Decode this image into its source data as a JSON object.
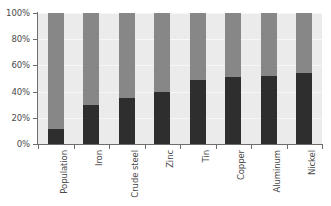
{
  "chart_data": {
    "type": "bar",
    "subtype": "stacked-100-percent",
    "title": "",
    "subtitle": "",
    "xlabel": "",
    "ylabel": "",
    "ylim": [
      0,
      100
    ],
    "yticks": [
      0,
      20,
      40,
      60,
      80,
      100
    ],
    "ytick_labels": [
      "0%",
      "20%",
      "40%",
      "60%",
      "80%",
      "100%"
    ],
    "grid": true,
    "grid_axis": "y",
    "legend": false,
    "legend_position": "none",
    "categories": [
      "Population",
      "Iron",
      "Crude steel",
      "Zinc",
      "Tin",
      "Copper",
      "Aluminum",
      "Nickel"
    ],
    "series": [
      {
        "name": "lower-segment",
        "color": "#2e2e2e",
        "values": [
          11.5,
          29.5,
          35.0,
          40.0,
          49.0,
          51.5,
          52.0,
          54.0
        ]
      },
      {
        "name": "upper-segment",
        "color": "#878787",
        "values": [
          88.5,
          70.5,
          65.0,
          60.0,
          51.0,
          48.5,
          48.0,
          46.0
        ]
      }
    ],
    "annotations": [],
    "colors": {
      "plot_background": "#ebebeb",
      "figure_background": "#ffffff",
      "axis_line": "#6d6d6d",
      "gridline": "#f7f7f7",
      "tick_text": "#4a4a4a"
    }
  }
}
